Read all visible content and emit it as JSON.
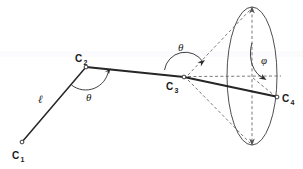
{
  "figure": {
    "title": "Internal coordinates diagram: bond length, bond angle and dihedral angle",
    "background_color": "#ffffff",
    "stroke_color": "#262626",
    "dashed_color": "#555555",
    "width": 303,
    "height": 169,
    "vertices": [
      {
        "id": "c1",
        "label": "C",
        "subscript": "1",
        "x": 22,
        "y": 142,
        "label_x": 12,
        "label_y": 158
      },
      {
        "id": "c2",
        "label": "C",
        "subscript": "2",
        "x": 86,
        "y": 67,
        "label_x": 76,
        "label_y": 62
      },
      {
        "id": "c3",
        "label": "C",
        "subscript": "3",
        "x": 184,
        "y": 77,
        "label_x": 168,
        "label_y": 89
      },
      {
        "id": "c4",
        "label": "C",
        "subscript": "4",
        "x": 277,
        "y": 97,
        "label_x": 282,
        "label_y": 101
      }
    ],
    "labels": {
      "bond_length": "ℓ",
      "bond_angle_c2": "θ",
      "bond_angle_c3": "θ",
      "dihedral_angle": "φ"
    },
    "label_positions": {
      "bond_length": {
        "x": 40,
        "y": 102
      },
      "bond_angle_c2": {
        "x": 90,
        "y": 99
      },
      "bond_angle_c3": {
        "x": 181,
        "y": 50
      },
      "dihedral_angle": {
        "x": 263,
        "y": 62
      }
    },
    "geometry": {
      "ellipse": {
        "cx": 252,
        "cy": 76,
        "rx": 25,
        "ry": 69
      },
      "bond_c1_c2": {
        "x1": 22,
        "y1": 142,
        "x2": 86,
        "y2": 67
      },
      "bond_c2_c3": {
        "x1": 86,
        "y1": 67,
        "x2": 184,
        "y2": 77
      },
      "bond_c3_c4": {
        "x1": 184,
        "y1": 77,
        "x2": 277,
        "y2": 97
      },
      "axis_dashed": {
        "x1": 184,
        "y1": 77,
        "x2": 280,
        "y2": 76
      },
      "cone_upper_dashed": {
        "x1": 184,
        "y1": 77,
        "x2": 252,
        "y2": 8
      },
      "cone_lower_dashed": {
        "x1": 184,
        "y1": 77,
        "x2": 252,
        "y2": 145
      },
      "vertical_dashed": {
        "x1": 252,
        "y1": 8,
        "x2": 252,
        "y2": 145
      }
    }
  }
}
